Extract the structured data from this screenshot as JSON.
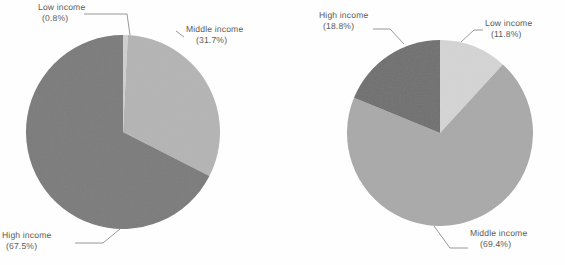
{
  "figure": {
    "background_color": "#fefefe",
    "label_color": "#5c5c5c",
    "leader_color": "#8d8d8d"
  },
  "chart_data": [
    {
      "type": "pie",
      "id": "left-pie",
      "title": "",
      "categories": [
        "Low income",
        "Middle income",
        "High income"
      ],
      "values": [
        0.8,
        31.7,
        67.5
      ],
      "value_unit": "%",
      "colors": [
        "#cfcfcf",
        "#b4b4b4",
        "#7b7b7b"
      ],
      "start_angle_deg": 90,
      "direction": "clockwise",
      "labels": [
        {
          "name": "Low income",
          "pct": "(0.8%)",
          "text": "Low income",
          "value": 0.8
        },
        {
          "name": "Middle income",
          "pct": "(31.7%)",
          "text": "Middle income",
          "value": 31.7
        },
        {
          "name": "High income",
          "pct": "(67.5%)",
          "text": "High income",
          "value": 67.5
        }
      ],
      "legend": "none",
      "grid": false
    },
    {
      "type": "pie",
      "id": "right-pie",
      "title": "",
      "categories": [
        "Low income",
        "Middle income",
        "High income"
      ],
      "values": [
        11.8,
        69.4,
        18.8
      ],
      "value_unit": "%",
      "colors": [
        "#d4d4d4",
        "#a9a9a9",
        "#707070"
      ],
      "start_angle_deg": 90,
      "direction": "clockwise",
      "labels": [
        {
          "name": "Low income",
          "pct": "(11.8%)",
          "text": "Low income",
          "value": 11.8
        },
        {
          "name": "Middle income",
          "pct": "(69.4%)",
          "text": "Middle income",
          "value": 69.4
        },
        {
          "name": "High income",
          "pct": "(18.8%)",
          "text": "High income",
          "value": 18.8
        }
      ],
      "legend": "none",
      "grid": false
    }
  ],
  "left_chart": {
    "low": {
      "label": "Low income",
      "pct": "(0.8%)"
    },
    "middle": {
      "label": "Middle income",
      "pct": "(31.7%)"
    },
    "high": {
      "label": "High income",
      "pct": "(67.5%)"
    }
  },
  "right_chart": {
    "low": {
      "label": "Low income",
      "pct": "(11.8%)"
    },
    "middle": {
      "label": "Middle income",
      "pct": "(69.4%)"
    },
    "high": {
      "label": "High income",
      "pct": "(18.8%)"
    }
  }
}
